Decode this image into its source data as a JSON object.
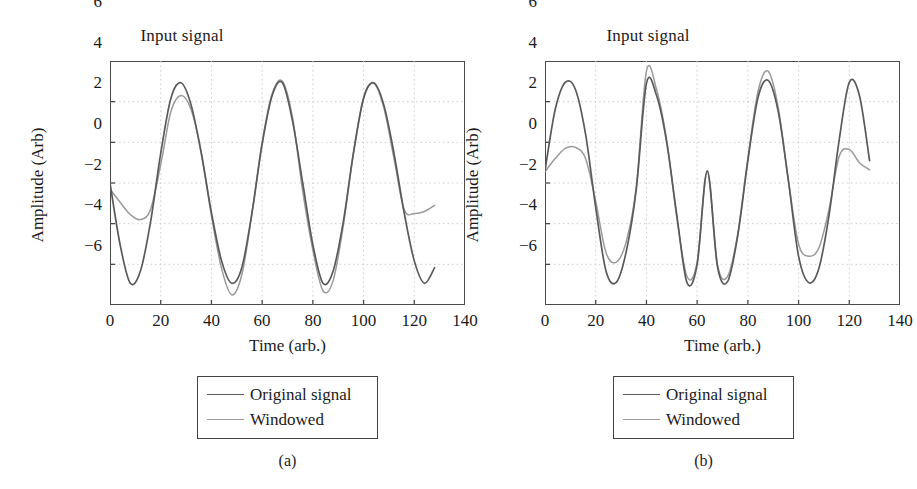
{
  "figure": {
    "background": "#ffffff",
    "panels": [
      {
        "id": "a",
        "caption": "(a)",
        "title": "Input signal",
        "xlabel": "Time (arb.)",
        "ylabel": "Amplitude (Arb)",
        "legend": {
          "entries": [
            {
              "label": "Original signal",
              "color": "#5a5a5a"
            },
            {
              "label": "Windowed",
              "color": "#9a9a9a"
            }
          ]
        }
      },
      {
        "id": "b",
        "caption": "(b)",
        "title": "Input signal",
        "xlabel": "Time (arb.)",
        "ylabel": "Amplitude (Arb)",
        "legend": {
          "entries": [
            {
              "label": "Original signal",
              "color": "#5a5a5a"
            },
            {
              "label": "Windowed",
              "color": "#9a9a9a"
            }
          ]
        }
      }
    ]
  },
  "chart_data": [
    {
      "type": "line",
      "panel": "a",
      "title": "Input signal",
      "xlabel": "Time (arb.)",
      "ylabel": "Amplitude (Arb)",
      "xlim": [
        0,
        140
      ],
      "ylim": [
        -6,
        6
      ],
      "xticks": [
        0,
        20,
        40,
        60,
        80,
        100,
        120,
        140
      ],
      "yticks": [
        -6,
        -4,
        -2,
        0,
        2,
        4,
        6
      ],
      "grid": true,
      "grid_style": "dotted",
      "data_x_range": [
        0,
        128
      ],
      "legend_position": "below-plot",
      "series": [
        {
          "name": "Original signal",
          "color": "#5a5a5a",
          "description": "Sum of two sinusoids, amplitude envelope ~5, full extent 0 to 128",
          "formula": "2.5*sin(2*pi*t/32) + 2.5*sin(2*pi*t/16)",
          "x": [
            0,
            4,
            8,
            12,
            16,
            20,
            24,
            28,
            32,
            36,
            40,
            44,
            48,
            52,
            56,
            60,
            64,
            68,
            72,
            76,
            80,
            84,
            88,
            92,
            96,
            100,
            104,
            108,
            112,
            116,
            120,
            124,
            128
          ],
          "y": [
            0.0,
            -3.04,
            -4.93,
            -4.33,
            -1.91,
            1.46,
            4.16,
            4.93,
            3.83,
            1.46,
            -1.46,
            -3.83,
            -4.93,
            -4.16,
            -1.46,
            1.91,
            4.33,
            4.93,
            3.04,
            0.0,
            -3.04,
            -4.93,
            -4.33,
            -1.91,
            1.46,
            4.16,
            4.93,
            3.83,
            1.46,
            -1.46,
            -3.83,
            -4.93,
            -4.16
          ]
        },
        {
          "name": "Windowed",
          "color": "#9a9a9a",
          "description": "Original signal multiplied by a taper window (near-unity in middle, reduced at edges); peaks reach ~3.8 at t=25, ~4.5 at t=56, ~5.5 troughs",
          "x": [
            0,
            4,
            8,
            12,
            16,
            20,
            24,
            28,
            32,
            36,
            40,
            44,
            48,
            52,
            56,
            60,
            64,
            68,
            72,
            76,
            80,
            84,
            88,
            92,
            96,
            100,
            104,
            108,
            112,
            116,
            120,
            124,
            128
          ],
          "y": [
            -0.3,
            -0.95,
            -1.55,
            -1.8,
            -1.3,
            0.9,
            3.5,
            4.3,
            3.6,
            1.5,
            -1.6,
            -4.2,
            -5.5,
            -4.5,
            -1.5,
            2.0,
            4.4,
            5.0,
            3.2,
            -0.4,
            -3.3,
            -5.3,
            -4.8,
            -2.1,
            1.5,
            4.2,
            4.9,
            3.7,
            1.2,
            -1.3,
            -1.5,
            -1.4,
            -1.1
          ]
        }
      ]
    },
    {
      "type": "line",
      "panel": "b",
      "title": "Input signal",
      "xlabel": "Time (arb.)",
      "ylabel": "Amplitude (Arb)",
      "xlim": [
        0,
        140
      ],
      "ylim": [
        -6,
        6
      ],
      "xticks": [
        0,
        20,
        40,
        60,
        80,
        100,
        120,
        140
      ],
      "yticks": [
        -6,
        -4,
        -2,
        0,
        2,
        4,
        6
      ],
      "grid": true,
      "grid_style": "dotted",
      "data_x_range": [
        0,
        128
      ],
      "legend_position": "below-plot",
      "series": [
        {
          "name": "Original signal",
          "color": "#5a5a5a",
          "description": "Same two-sinusoid signal, phase-shifted: starts near +0.6, first peak ~5 at t=9",
          "x": [
            0,
            4,
            8,
            12,
            16,
            20,
            24,
            28,
            32,
            36,
            40,
            44,
            48,
            52,
            56,
            60,
            64,
            68,
            72,
            76,
            80,
            84,
            88,
            92,
            96,
            100,
            104,
            108,
            112,
            116,
            120,
            124,
            128
          ],
          "y": [
            0.6,
            3.6,
            4.95,
            4.6,
            2.4,
            -1.2,
            -4.3,
            -4.9,
            -3.4,
            -0.3,
            4.9,
            4.3,
            2.0,
            -1.6,
            -4.9,
            -4.0,
            0.6,
            -4.1,
            -4.85,
            -2.6,
            1.1,
            4.2,
            5.05,
            3.5,
            0.1,
            -3.6,
            -4.9,
            -4.2,
            -1.6,
            2.1,
            4.95,
            4.3,
            1.1
          ]
        },
        {
          "name": "Windowed",
          "color": "#9a9a9a",
          "description": "Tapered version: first hump only reaches ~1.75 at t=12, mid peaks slightly exceed original (~5.5), tail settles to ~0.65",
          "x": [
            0,
            4,
            8,
            12,
            16,
            20,
            24,
            28,
            32,
            36,
            40,
            44,
            48,
            52,
            56,
            60,
            64,
            68,
            72,
            76,
            80,
            84,
            88,
            92,
            96,
            100,
            104,
            108,
            112,
            116,
            120,
            124,
            128
          ],
          "y": [
            0.55,
            1.2,
            1.7,
            1.75,
            1.2,
            -0.9,
            -3.4,
            -3.9,
            -2.9,
            -0.2,
            5.5,
            4.6,
            2.1,
            -1.7,
            -4.6,
            -3.9,
            0.55,
            -4.0,
            -4.6,
            -2.5,
            1.2,
            4.5,
            5.5,
            3.7,
            0.1,
            -3.0,
            -3.6,
            -3.2,
            -1.3,
            1.3,
            1.65,
            1.0,
            0.65
          ]
        }
      ]
    }
  ],
  "axis_tick_labels": {
    "x": [
      "0",
      "20",
      "40",
      "60",
      "80",
      "100",
      "120",
      "140"
    ],
    "y": [
      "6",
      "4",
      "2",
      "0",
      "−2",
      "−4",
      "−6"
    ]
  },
  "colors": {
    "original_signal": "#5a5a5a",
    "windowed": "#9a9a9a",
    "axis": "#4a4a4a",
    "grid": "#c8c8d2",
    "text": "#1b1b1b",
    "background": "#ffffff"
  }
}
